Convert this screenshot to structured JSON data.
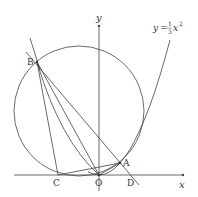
{
  "diagram": {
    "type": "geometry-figure",
    "curve_label": {
      "y": "y",
      "eq": "=",
      "num": "1",
      "den": "3",
      "x": "x",
      "exp": "2"
    },
    "axes": {
      "x_label": "x",
      "y_label": "y",
      "origin_label": "O"
    },
    "points": {
      "A": {
        "label": "A"
      },
      "B": {
        "label": "B"
      },
      "C": {
        "label": "C"
      },
      "D": {
        "label": "D"
      }
    },
    "colors": {
      "line": "#444444",
      "text": "#333333",
      "background": "#ffffff"
    }
  }
}
